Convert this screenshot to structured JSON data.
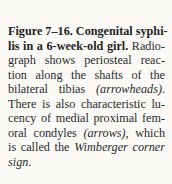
{
  "caption": {
    "figure_label": "Figure 7–16.",
    "title_part1": " Congenital syphi-",
    "title_part2": "lis in a 6-week-old girl.",
    "lines": {
      "l2_rest": " Radio-",
      "l3": "graph shows periosteal reac-",
      "l4": "tion along the shafts of the",
      "l5_a": "bilateral tibias ",
      "l5_italic": "(arrowheads)",
      "l5_b": ".",
      "l6": "There is also characteristic lu-",
      "l7": "cency of medial proximal fem-",
      "l8_a": "oral condyles ",
      "l8_italic": "(arrows)",
      "l8_b": ", which",
      "l9_a": "is called the ",
      "l9_italic": "Wimberger corner",
      "l10_italic": "sign",
      "l10_b": "."
    }
  }
}
